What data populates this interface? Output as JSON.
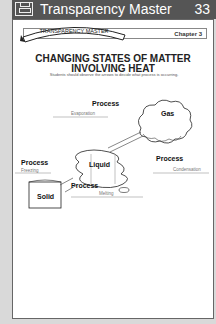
{
  "header": {
    "title": "Transparency Master",
    "number": "33",
    "icon": "transparency-projector-icon"
  },
  "banner": {
    "ribbon_text": "TRANSPARENCY MASTER",
    "chapter": "Chapter 3"
  },
  "content": {
    "title_line1": "CHANGING STATES OF MATTER",
    "title_line2": "INVOLVING HEAT",
    "instructions": "Students should observe the arrows to decide what process is occurring."
  },
  "diagram": {
    "states": {
      "gas": "Gas",
      "liquid": "Liquid",
      "solid": "Solid"
    },
    "processes": [
      {
        "label": "Process",
        "answer": "Evaporation"
      },
      {
        "label": "Process",
        "answer": "Condensation"
      },
      {
        "label": "Process",
        "answer": "Freezing"
      },
      {
        "label": "Process",
        "answer": "Melting"
      }
    ]
  }
}
